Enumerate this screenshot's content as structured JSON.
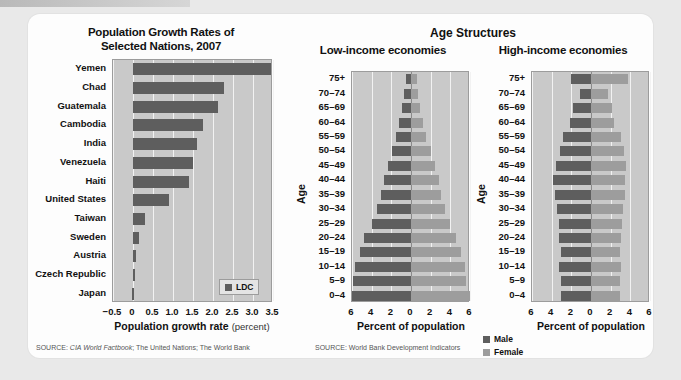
{
  "figure": {
    "group_heading": "Age Structures"
  },
  "chart_data": [
    {
      "type": "bar",
      "orientation": "horizontal",
      "title": "Population Growth Rates of Selected Nations, 2007",
      "title_line1": "Population Growth Rates of",
      "title_line2": "Selected Nations, 2007",
      "xlabel": "Population growth rate",
      "xlabel_unit": "(percent)",
      "ylabel": "",
      "xlim": [
        -0.5,
        3.5
      ],
      "ticks": [
        "−0.5",
        "0",
        "0.5",
        "1.0",
        "1.5",
        "2.0",
        "2.5",
        "3.0",
        "3.5"
      ],
      "tick_values": [
        -0.5,
        0,
        0.5,
        1.0,
        1.5,
        2.0,
        2.5,
        3.0,
        3.5
      ],
      "grid": true,
      "legend": [
        "LDC"
      ],
      "legend_position": "bottom-right",
      "categories": [
        "Yemen",
        "Chad",
        "Guatemala",
        "Cambodia",
        "India",
        "Venezuela",
        "Haiti",
        "United States",
        "Taiwan",
        "Sweden",
        "Austria",
        "Czech Republic",
        "Japan"
      ],
      "values": [
        3.45,
        2.27,
        2.13,
        1.75,
        1.61,
        1.5,
        1.4,
        0.89,
        0.3,
        0.16,
        0.08,
        0.01,
        -0.02
      ],
      "source": "SOURCE: CIA World Factbook; The United Nations; The World Bank",
      "source_prefix": "SOURCE:",
      "source_italic": "CIA World Factbook",
      "source_rest": "; The United Nations; The World Bank"
    },
    {
      "type": "bar",
      "subtype": "population-pyramid",
      "title": "Low-income economies",
      "xlabel": "Percent of population",
      "ylabel": "Age",
      "xlim": [
        -6,
        6
      ],
      "ticks": [
        "6",
        "4",
        "2",
        "0",
        "2",
        "4",
        "6"
      ],
      "tick_values": [
        6,
        4,
        2,
        0,
        2,
        4,
        6
      ],
      "grid": true,
      "categories": [
        "75+",
        "70–74",
        "65–69",
        "60–64",
        "55–59",
        "50–54",
        "45–49",
        "40–44",
        "35–39",
        "30–34",
        "25–29",
        "20–24",
        "15–19",
        "10–14",
        "5–9",
        "0–4"
      ],
      "series": [
        {
          "name": "Male",
          "values": [
            0.55,
            0.7,
            0.9,
            1.2,
            1.5,
            1.95,
            2.35,
            2.75,
            3.05,
            3.45,
            4.0,
            4.75,
            5.2,
            5.7,
            5.85,
            6.0
          ]
        },
        {
          "name": "Female",
          "values": [
            0.6,
            0.75,
            0.95,
            1.25,
            1.55,
            2.0,
            2.4,
            2.8,
            3.1,
            3.5,
            4.0,
            4.6,
            5.05,
            5.45,
            5.6,
            6.0
          ]
        }
      ],
      "source": "SOURCE: World Bank Development Indicators"
    },
    {
      "type": "bar",
      "subtype": "population-pyramid",
      "title": "High-income economies",
      "xlabel": "Percent of population",
      "ylabel": "Age",
      "xlim": [
        -6,
        6
      ],
      "ticks": [
        "6",
        "4",
        "2",
        "0",
        "2",
        "4",
        "6"
      ],
      "tick_values": [
        6,
        4,
        2,
        0,
        2,
        4,
        6
      ],
      "grid": true,
      "categories": [
        "75+",
        "70–74",
        "65–69",
        "60–64",
        "55–59",
        "50–54",
        "45–49",
        "40–44",
        "35–39",
        "30–34",
        "25–29",
        "20–24",
        "15–19",
        "10–14",
        "5–9",
        "0–4"
      ],
      "series": [
        {
          "name": "Male",
          "values": [
            2.05,
            1.15,
            1.85,
            2.1,
            2.85,
            3.15,
            3.6,
            3.85,
            3.65,
            3.5,
            3.3,
            3.25,
            3.1,
            3.25,
            3.1,
            3.05
          ]
        },
        {
          "name": "Female",
          "values": [
            3.75,
            1.75,
            2.15,
            2.35,
            3.05,
            3.35,
            3.55,
            3.5,
            3.45,
            3.3,
            3.15,
            3.1,
            2.95,
            3.05,
            2.95,
            2.9
          ]
        }
      ],
      "legend": [
        "Male",
        "Female"
      ],
      "legend_position": "bottom-left"
    }
  ],
  "colors": {
    "male": "#5e5e5e",
    "female": "#9d9d9d",
    "plot_bg": "#c9c9c9",
    "grid": "#f2f2f2",
    "card_bg": "#fdfdfd",
    "page_bg": "#e9e9e9"
  }
}
